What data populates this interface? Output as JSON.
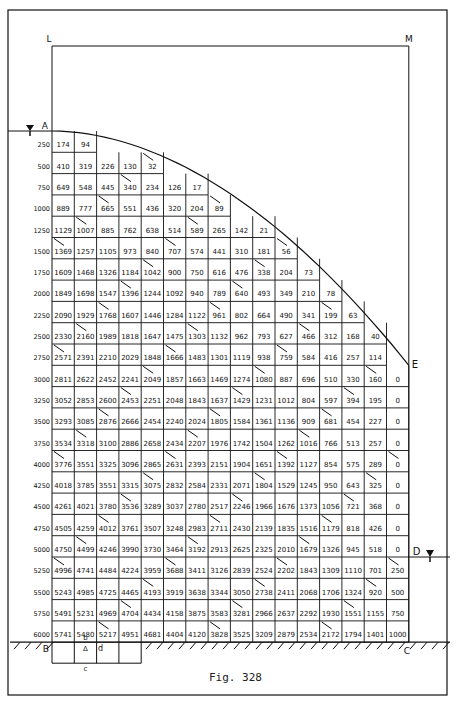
{
  "figure": {
    "caption": "Fig. 328",
    "point_labels": {
      "L": "L",
      "M": "M",
      "A": "A",
      "B": "B",
      "C": "C",
      "D": "D",
      "E": "E",
      "a": "a",
      "b": "b",
      "c": "c",
      "d": "d",
      "delta": "Δ"
    }
  },
  "grid": {
    "columns": 16,
    "depth_labels": [
      "250",
      "500",
      "750",
      "1000",
      "1250",
      "1500",
      "1750",
      "2000",
      "2250",
      "2500",
      "2750",
      "3000",
      "3250",
      "3500",
      "3750",
      "4000",
      "4250",
      "4500",
      "4750",
      "5000",
      "5250",
      "5500",
      "5750",
      "6000"
    ],
    "rows": [
      [
        "174",
        "94"
      ],
      [
        "410",
        "319",
        "226",
        "130",
        "32"
      ],
      [
        "649",
        "548",
        "445",
        "340",
        "234",
        "126",
        "17"
      ],
      [
        "889",
        "777",
        "665",
        "551",
        "436",
        "320",
        "204",
        "89"
      ],
      [
        "1129",
        "1007",
        "885",
        "762",
        "638",
        "514",
        "589",
        "265",
        "142",
        "21"
      ],
      [
        "1369",
        "1257",
        "1105",
        "973",
        "840",
        "707",
        "574",
        "441",
        "310",
        "181",
        "56"
      ],
      [
        "1609",
        "1468",
        "1326",
        "1184",
        "1042",
        "900",
        "750",
        "616",
        "476",
        "338",
        "204",
        "73"
      ],
      [
        "1849",
        "1698",
        "1547",
        "1396",
        "1244",
        "1092",
        "940",
        "789",
        "640",
        "493",
        "349",
        "210",
        "78"
      ],
      [
        "2090",
        "1929",
        "1768",
        "1607",
        "1446",
        "1284",
        "1122",
        "961",
        "802",
        "664",
        "490",
        "341",
        "199",
        "63"
      ],
      [
        "2330",
        "2160",
        "1989",
        "1818",
        "1647",
        "1475",
        "1303",
        "1132",
        "962",
        "793",
        "627",
        "466",
        "312",
        "168",
        "40"
      ],
      [
        "2571",
        "2391",
        "2210",
        "2029",
        "1848",
        "1666",
        "1483",
        "1301",
        "1119",
        "938",
        "759",
        "584",
        "416",
        "257",
        "114"
      ],
      [
        "2811",
        "2622",
        "2452",
        "2241",
        "2049",
        "1857",
        "1663",
        "1469",
        "1274",
        "1080",
        "887",
        "696",
        "510",
        "330",
        "160",
        "0"
      ],
      [
        "3052",
        "2853",
        "2600",
        "2453",
        "2251",
        "2048",
        "1843",
        "1637",
        "1429",
        "1231",
        "1012",
        "804",
        "597",
        "394",
        "195",
        "0"
      ],
      [
        "3293",
        "3085",
        "2876",
        "2666",
        "2454",
        "2240",
        "2024",
        "1805",
        "1584",
        "1361",
        "1136",
        "909",
        "681",
        "454",
        "227",
        "0"
      ],
      [
        "3534",
        "3318",
        "3100",
        "2886",
        "2658",
        "2434",
        "2207",
        "1976",
        "1742",
        "1504",
        "1262",
        "1016",
        "766",
        "513",
        "257",
        "0"
      ],
      [
        "3776",
        "3551",
        "3325",
        "3096",
        "2865",
        "2631",
        "2393",
        "2151",
        "1904",
        "1651",
        "1392",
        "1127",
        "854",
        "575",
        "289",
        "0"
      ],
      [
        "4018",
        "3785",
        "3551",
        "3315",
        "3075",
        "2832",
        "2584",
        "2331",
        "2071",
        "1804",
        "1529",
        "1245",
        "950",
        "643",
        "325",
        "0"
      ],
      [
        "4261",
        "4021",
        "3780",
        "3536",
        "3289",
        "3037",
        "2780",
        "2517",
        "2246",
        "1966",
        "1676",
        "1373",
        "1056",
        "721",
        "368",
        "0"
      ],
      [
        "4505",
        "4259",
        "4012",
        "3761",
        "3507",
        "3248",
        "2983",
        "2711",
        "2430",
        "2139",
        "1835",
        "1516",
        "1179",
        "818",
        "426",
        "0"
      ],
      [
        "4750",
        "4499",
        "4246",
        "3990",
        "3730",
        "3464",
        "3192",
        "2913",
        "2625",
        "2325",
        "2010",
        "1679",
        "1326",
        "945",
        "518",
        "0"
      ],
      [
        "4996",
        "4741",
        "4484",
        "4224",
        "3959",
        "3688",
        "3411",
        "3126",
        "2839",
        "2524",
        "2202",
        "1843",
        "1309",
        "1110",
        "701",
        "250"
      ],
      [
        "5243",
        "4985",
        "4725",
        "4465",
        "4193",
        "3919",
        "3638",
        "3344",
        "3050",
        "2738",
        "2411",
        "2068",
        "1706",
        "1324",
        "920",
        "500"
      ],
      [
        "5491",
        "5231",
        "4969",
        "4704",
        "4434",
        "4158",
        "3875",
        "3583",
        "3281",
        "2966",
        "2637",
        "2292",
        "1930",
        "1551",
        "1155",
        "750"
      ],
      [
        "5741",
        "5480",
        "5217",
        "4951",
        "4681",
        "4404",
        "4120",
        "3828",
        "3525",
        "3209",
        "2879",
        "2534",
        "2172",
        "1794",
        "1401",
        "1000"
      ]
    ]
  },
  "colors": {
    "ink": "#111111",
    "paper": "#ffffff"
  }
}
